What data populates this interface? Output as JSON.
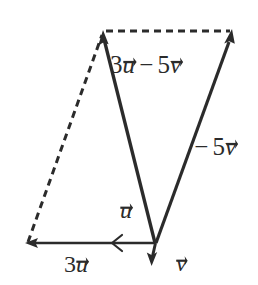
{
  "figure": {
    "type": "vector-diagram",
    "background_color": "#ffffff",
    "stroke_color": "#2b2b2b",
    "width": 258,
    "height": 285
  },
  "labels": {
    "resultant": {
      "coefficient_u": "3",
      "var_u": "u",
      "operator": "−",
      "coefficient_v": "5",
      "var_v": "v"
    },
    "neg_five_v": {
      "operator": "−",
      "coefficient": "5",
      "var": "v"
    },
    "u": {
      "var": "u"
    },
    "three_u": {
      "coefficient": "3",
      "var": "u"
    },
    "v": {
      "var": "v"
    }
  },
  "points": {
    "origin": {
      "x": 155,
      "y": 243
    },
    "apex_left": {
      "x": 103,
      "y": 33
    },
    "apex_right": {
      "x": 231,
      "y": 33
    },
    "three_u_tip": {
      "x": 27,
      "y": 243
    },
    "v_tip": {
      "x": 152,
      "y": 265
    }
  },
  "vectors": [
    {
      "name": "resultant-3u-minus-5v",
      "from": "origin",
      "to": "apex_left",
      "style": "solid",
      "arrow": "end"
    },
    {
      "name": "neg-5v",
      "from": "origin",
      "to": "apex_right",
      "style": "solid",
      "arrow": "end"
    },
    {
      "name": "three-u",
      "from": "origin",
      "to": "three_u_tip",
      "style": "solid",
      "arrow": "end"
    },
    {
      "name": "v",
      "from": "origin",
      "to": "v_tip",
      "style": "solid",
      "arrow": "end"
    },
    {
      "name": "construction-left",
      "from": "three_u_tip",
      "to": "apex_left",
      "style": "dashed",
      "arrow": "none"
    },
    {
      "name": "construction-top",
      "from": "apex_left",
      "to": "apex_right",
      "style": "dashed",
      "arrow": "none"
    }
  ]
}
